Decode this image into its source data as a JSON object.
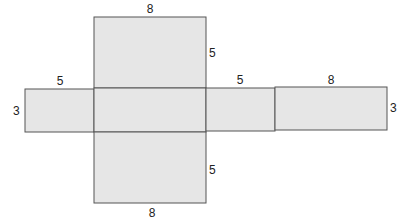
{
  "diagram": {
    "type": "net of rectangular prism",
    "colors": {
      "face_fill": "#e6e6e6",
      "edge": "#555555",
      "label": "#222222"
    },
    "faces": [
      {
        "name": "top-face",
        "x": 94,
        "y": 17,
        "w": 112,
        "h": 71
      },
      {
        "name": "left-face",
        "x": 25,
        "y": 89,
        "w": 69,
        "h": 43
      },
      {
        "name": "center-face",
        "x": 94,
        "y": 88,
        "w": 112,
        "h": 44
      },
      {
        "name": "right-face",
        "x": 206,
        "y": 88,
        "w": 69,
        "h": 43
      },
      {
        "name": "back-face",
        "x": 275,
        "y": 87,
        "w": 112,
        "h": 43
      },
      {
        "name": "bottom-face",
        "x": 94,
        "y": 132,
        "w": 112,
        "h": 71
      }
    ],
    "labels": {
      "top_width": "8",
      "top_height": "5",
      "left_width": "5",
      "left_height": "3",
      "right_width": "5",
      "back_width": "8",
      "back_height": "3",
      "bottom_height": "5",
      "bottom_width": "8"
    }
  }
}
